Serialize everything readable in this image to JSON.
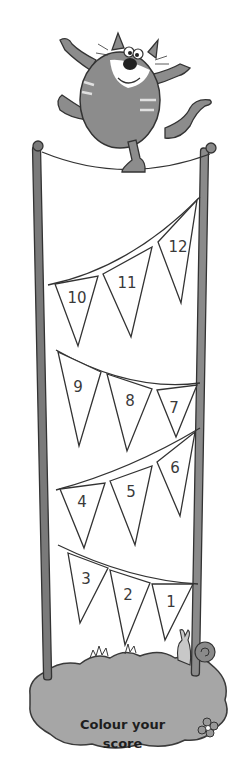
{
  "illustration": {
    "character": "tightrope-walking cat",
    "caption": {
      "line1": "Colour your",
      "line2": "score"
    },
    "bunting": {
      "rows": [
        {
          "flags": [
            "12",
            "11",
            "10"
          ]
        },
        {
          "flags": [
            "9",
            "8",
            "7"
          ]
        },
        {
          "flags": [
            "6",
            "5",
            "4"
          ]
        },
        {
          "flags": [
            "3",
            "2",
            "1"
          ]
        }
      ]
    },
    "colors": {
      "outline": "#3a3a3a",
      "post": "#7a7a7a",
      "cat_body": "#8c8c8c",
      "grass": "#9e9e9e",
      "flag_fill": "#ffffff"
    }
  }
}
